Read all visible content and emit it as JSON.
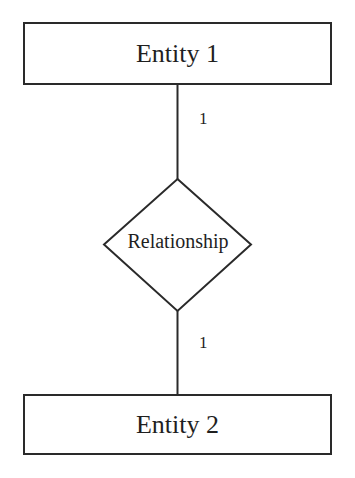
{
  "diagram": {
    "type": "er-diagram",
    "entities": [
      {
        "id": "entity-1",
        "label": "Entity 1"
      },
      {
        "id": "entity-2",
        "label": "Entity 2"
      }
    ],
    "relationship": {
      "label": "Relationship"
    },
    "cardinalities": {
      "top": "1",
      "bottom": "1"
    },
    "colors": {
      "stroke": "#2a2a2a",
      "text": "#1f1f1f",
      "background": "#ffffff"
    }
  }
}
